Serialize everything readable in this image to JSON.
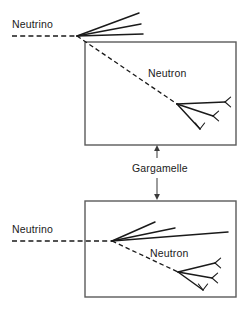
{
  "figure": {
    "background_color": "#ffffff",
    "width": 251,
    "height": 314,
    "ink_color": "#1a1a1a",
    "box_color": "#5b5b5b",
    "pointer_color": "#4a4a4a"
  },
  "labels": {
    "neutrino_top": "Neutrino",
    "neutron_top": "Neutron",
    "gargamelle": "Gargamelle",
    "neutrino_bottom": "Neutrino",
    "neutron_bottom": "Neutron"
  },
  "panels": {
    "top": {
      "name": "upper-event-panel",
      "box": {
        "x": 85,
        "y": 42,
        "width": 151,
        "height": 103
      },
      "primary_vertex": {
        "x": 77,
        "y": 36
      },
      "secondary_vertex": {
        "x": 177,
        "y": 104
      },
      "beam_line": {
        "x1": 12,
        "y1": 36,
        "x2": 77,
        "y2": 36
      },
      "neutron_line": {
        "x1": 77,
        "y1": 36,
        "x2": 177,
        "y2": 104
      },
      "outgoing_tracks": [
        {
          "x2": 139,
          "y2": 13
        },
        {
          "x2": 141,
          "y2": 24
        },
        {
          "x2": 143,
          "y2": 34
        }
      ],
      "secondary_tracks": [
        {
          "x2": 225,
          "y2": 102,
          "fork": "left"
        },
        {
          "x2": 213,
          "y2": 116,
          "fork": "left"
        },
        {
          "x2": 200,
          "y2": 129,
          "fork": "up"
        }
      ],
      "neutrino_label_pos": {
        "x": 12,
        "y": 28
      },
      "neutron_label_pos": {
        "x": 148,
        "y": 77
      }
    },
    "bottom": {
      "name": "lower-event-panel",
      "box": {
        "x": 85,
        "y": 201,
        "width": 151,
        "height": 96
      },
      "primary_vertex": {
        "x": 112,
        "y": 241
      },
      "secondary_vertex": {
        "x": 178,
        "y": 272
      },
      "beam_line": {
        "x1": 12,
        "y1": 241,
        "x2": 112,
        "y2": 241
      },
      "neutron_line": {
        "x1": 112,
        "y1": 241,
        "x2": 178,
        "y2": 272
      },
      "outgoing_tracks": [
        {
          "x2": 155,
          "y2": 222
        },
        {
          "x2": 175,
          "y2": 228
        },
        {
          "x2": 228,
          "y2": 232
        }
      ],
      "secondary_tracks": [
        {
          "x2": 215,
          "y2": 263,
          "fork": "left"
        },
        {
          "x2": 212,
          "y2": 278,
          "fork": "left"
        },
        {
          "x2": 203,
          "y2": 290,
          "fork": "up"
        }
      ],
      "neutrino_label_pos": {
        "x": 12,
        "y": 233
      },
      "neutron_label_pos": {
        "x": 150,
        "y": 257
      }
    }
  },
  "pointers": {
    "gargamelle_label_pos": {
      "x": 132,
      "y": 172
    },
    "arrow_up": {
      "x": 157,
      "y_tail": 158,
      "y_head": 145
    },
    "arrow_down": {
      "x": 157,
      "y_tail": 186,
      "y_head": 200
    }
  }
}
